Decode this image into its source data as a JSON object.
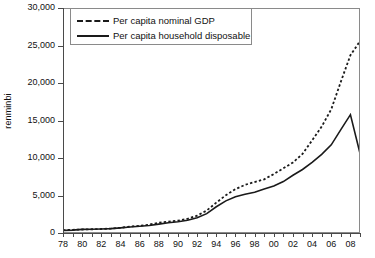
{
  "chart_data": {
    "type": "line",
    "title": "",
    "xlabel": "",
    "ylabel": "renminbi",
    "ylim": [
      0,
      30000
    ],
    "yticks": [
      "0",
      "5,000",
      "10,000",
      "15,000",
      "20,000",
      "25,000",
      "30,000"
    ],
    "ytick_values": [
      0,
      5000,
      10000,
      15000,
      20000,
      25000,
      30000
    ],
    "xlim": [
      1978,
      2009
    ],
    "xtick_labels": [
      "78",
      "80",
      "82",
      "84",
      "86",
      "88",
      "90",
      "92",
      "94",
      "96",
      "98",
      "00",
      "02",
      "04",
      "06",
      "08"
    ],
    "xtick_values": [
      1978,
      1980,
      1982,
      1984,
      1986,
      1988,
      1990,
      1992,
      1994,
      1996,
      1998,
      2000,
      2002,
      2004,
      2006,
      2008
    ],
    "grid": false,
    "legend_position": "top-left",
    "x": [
      1978,
      1979,
      1980,
      1981,
      1982,
      1983,
      1984,
      1985,
      1986,
      1987,
      1988,
      1989,
      1990,
      1991,
      1992,
      1993,
      1994,
      1995,
      1996,
      1997,
      1998,
      1999,
      2000,
      2001,
      2002,
      2003,
      2004,
      2005,
      2006,
      2007,
      2008,
      2009
    ],
    "series": [
      {
        "name": "Per capita nominal GDP",
        "style": "dashed",
        "color": "#1a1a1a",
        "values": [
          385,
          423,
          468,
          497,
          533,
          593,
          695,
          858,
          963,
          1112,
          1366,
          1519,
          1644,
          1893,
          2311,
          2998,
          4044,
          5046,
          5846,
          6420,
          6796,
          7159,
          7858,
          8622,
          9398,
          10542,
          12336,
          14185,
          16500,
          20169,
          23708,
          25575
        ]
      },
      {
        "name": "Per capita household disposable",
        "style": "solid",
        "color": "#1a1a1a",
        "values": [
          343,
          387,
          478,
          501,
          535,
          585,
          686,
          790,
          900,
          1002,
          1181,
          1376,
          1510,
          1700,
          2027,
          2577,
          3496,
          4283,
          4839,
          5160,
          5425,
          5854,
          6280,
          6860,
          7703,
          8472,
          9422,
          10493,
          11759,
          13786,
          15781,
          10600
        ]
      }
    ]
  },
  "legend": {
    "items": [
      {
        "label": "Per capita nominal GDP",
        "key": "dashed-line-key"
      },
      {
        "label": "Per capita household disposable",
        "key": "solid-line-key"
      }
    ]
  },
  "axes": {
    "y_title": "renminbi"
  }
}
